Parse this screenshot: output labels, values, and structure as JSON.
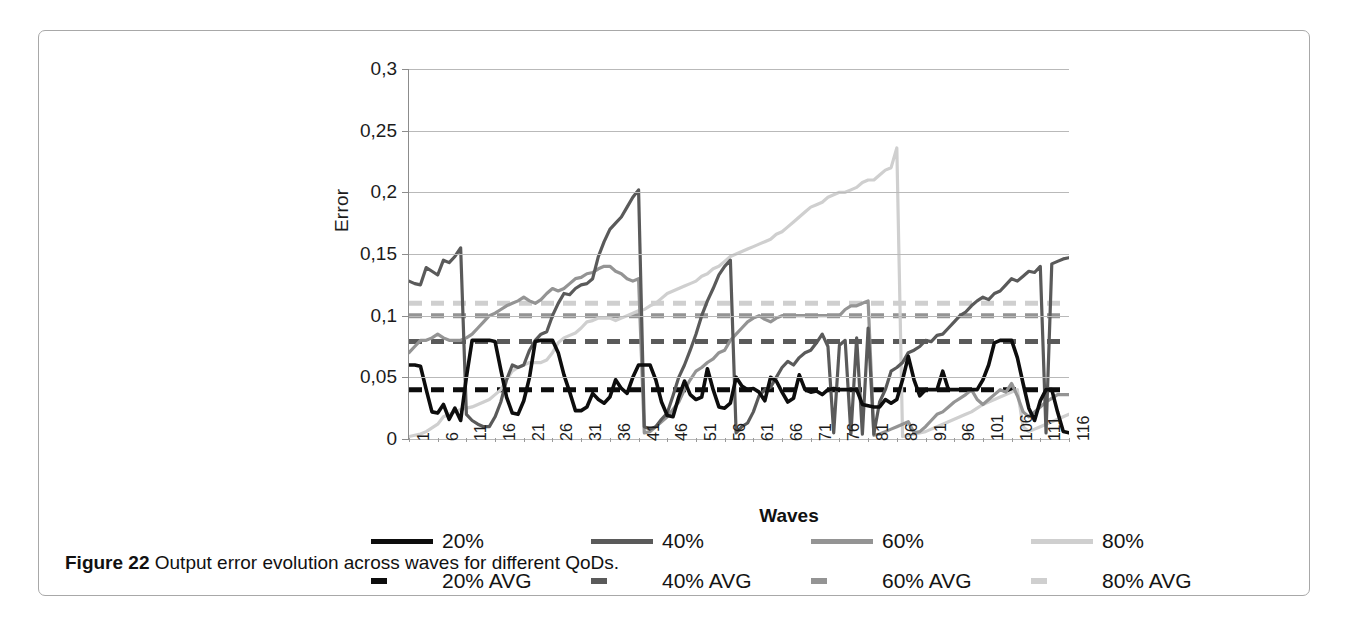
{
  "caption": {
    "label": "Figure 22",
    "text": " Output error evolution across waves for different QoDs."
  },
  "axes": {
    "y_title": "Error",
    "x_title": "Waves",
    "y_ticks": [
      "0",
      "0,05",
      "0,1",
      "0,15",
      "0,2",
      "0,25",
      "0,3"
    ],
    "x_ticks": [
      "1",
      "6",
      "11",
      "16",
      "21",
      "26",
      "31",
      "36",
      "41",
      "46",
      "51",
      "56",
      "61",
      "66",
      "71",
      "76",
      "81",
      "86",
      "91",
      "96",
      "101",
      "106",
      "111",
      "116"
    ]
  },
  "legend": {
    "items": [
      {
        "label": "20%",
        "color": "#0d0d0d",
        "style": "solid"
      },
      {
        "label": "40%",
        "color": "#5a5a5a",
        "style": "solid"
      },
      {
        "label": "60%",
        "color": "#949494",
        "style": "solid"
      },
      {
        "label": "80%",
        "color": "#cfcfcf",
        "style": "solid"
      },
      {
        "label": "20% AVG",
        "color": "#0d0d0d",
        "style": "dashed"
      },
      {
        "label": "40% AVG",
        "color": "#5a5a5a",
        "style": "dashed"
      },
      {
        "label": "60% AVG",
        "color": "#949494",
        "style": "dashed"
      },
      {
        "label": "80% AVG",
        "color": "#cfcfcf",
        "style": "dashed"
      }
    ]
  },
  "chart_data": {
    "type": "line",
    "title": "",
    "xlabel": "Waves",
    "ylabel": "Error",
    "xlim": [
      1,
      116
    ],
    "ylim": [
      0,
      0.3
    ],
    "grid": true,
    "legend_position": "bottom",
    "x": [
      1,
      2,
      3,
      4,
      5,
      6,
      7,
      8,
      9,
      10,
      11,
      12,
      13,
      14,
      15,
      16,
      17,
      18,
      19,
      20,
      21,
      22,
      23,
      24,
      25,
      26,
      27,
      28,
      29,
      30,
      31,
      32,
      33,
      34,
      35,
      36,
      37,
      38,
      39,
      40,
      41,
      42,
      43,
      44,
      45,
      46,
      47,
      48,
      49,
      50,
      51,
      52,
      53,
      54,
      55,
      56,
      57,
      58,
      59,
      60,
      61,
      62,
      63,
      64,
      65,
      66,
      67,
      68,
      69,
      70,
      71,
      72,
      73,
      74,
      75,
      76,
      77,
      78,
      79,
      80,
      81,
      82,
      83,
      84,
      85,
      86,
      87,
      88,
      89,
      90,
      91,
      92,
      93,
      94,
      95,
      96,
      97,
      98,
      99,
      100,
      101,
      102,
      103,
      104,
      105,
      106,
      107,
      108,
      109,
      110,
      111,
      112,
      113,
      114,
      115,
      116
    ],
    "series": [
      {
        "name": "20%",
        "color": "#0d0d0d",
        "style": "solid",
        "values": [
          0.06,
          0.06,
          0.059,
          0.04,
          0.022,
          0.021,
          0.028,
          0.016,
          0.025,
          0.015,
          0.05,
          0.08,
          0.08,
          0.08,
          0.08,
          0.079,
          0.056,
          0.034,
          0.021,
          0.02,
          0.031,
          0.05,
          0.079,
          0.08,
          0.08,
          0.08,
          0.07,
          0.052,
          0.038,
          0.023,
          0.023,
          0.026,
          0.037,
          0.032,
          0.029,
          0.034,
          0.048,
          0.041,
          0.037,
          0.05,
          0.06,
          0.06,
          0.06,
          0.048,
          0.03,
          0.019,
          0.018,
          0.034,
          0.047,
          0.036,
          0.032,
          0.034,
          0.057,
          0.04,
          0.026,
          0.025,
          0.029,
          0.05,
          0.043,
          0.04,
          0.041,
          0.038,
          0.031,
          0.05,
          0.047,
          0.038,
          0.03,
          0.033,
          0.052,
          0.04,
          0.038,
          0.039,
          0.036,
          0.04,
          0.041,
          0.04,
          0.04,
          0.04,
          0.04,
          0.028,
          0.027,
          0.026,
          0.026,
          0.032,
          0.029,
          0.032,
          0.048,
          0.067,
          0.048,
          0.035,
          0.04,
          0.04,
          0.04,
          0.055,
          0.04,
          0.04,
          0.04,
          0.04,
          0.04,
          0.04,
          0.048,
          0.06,
          0.078,
          0.08,
          0.08,
          0.08,
          0.066,
          0.045,
          0.025,
          0.015,
          0.031,
          0.04,
          0.04,
          0.022,
          0.006,
          0.005
        ]
      },
      {
        "name": "40%",
        "color": "#5a5a5a",
        "style": "solid",
        "values": [
          0.128,
          0.126,
          0.125,
          0.139,
          0.136,
          0.133,
          0.145,
          0.143,
          0.148,
          0.155,
          0.02,
          0.015,
          0.012,
          0.01,
          0.01,
          0.018,
          0.03,
          0.048,
          0.06,
          0.058,
          0.06,
          0.072,
          0.08,
          0.085,
          0.087,
          0.1,
          0.11,
          0.118,
          0.117,
          0.122,
          0.125,
          0.126,
          0.13,
          0.148,
          0.16,
          0.17,
          0.175,
          0.18,
          0.188,
          0.196,
          0.202,
          0.01,
          0.008,
          0.01,
          0.016,
          0.021,
          0.035,
          0.05,
          0.06,
          0.072,
          0.085,
          0.1,
          0.112,
          0.122,
          0.133,
          0.14,
          0.145,
          0.005,
          0.01,
          0.013,
          0.022,
          0.035,
          0.04,
          0.042,
          0.05,
          0.058,
          0.063,
          0.06,
          0.066,
          0.07,
          0.072,
          0.078,
          0.085,
          0.075,
          0.005,
          0.076,
          0.08,
          0.004,
          0.082,
          0.004,
          0.09,
          0.004,
          0.03,
          0.04,
          0.055,
          0.058,
          0.062,
          0.07,
          0.072,
          0.075,
          0.08,
          0.079,
          0.084,
          0.085,
          0.09,
          0.095,
          0.1,
          0.103,
          0.108,
          0.112,
          0.115,
          0.113,
          0.118,
          0.12,
          0.125,
          0.13,
          0.128,
          0.132,
          0.136,
          0.135,
          0.14,
          0.005,
          0.142,
          0.144,
          0.146,
          0.147
        ]
      },
      {
        "name": "60%",
        "color": "#949494",
        "style": "solid",
        "values": [
          0.07,
          0.075,
          0.08,
          0.08,
          0.082,
          0.085,
          0.082,
          0.08,
          0.08,
          0.08,
          0.082,
          0.085,
          0.09,
          0.095,
          0.1,
          0.102,
          0.105,
          0.108,
          0.11,
          0.112,
          0.115,
          0.112,
          0.11,
          0.113,
          0.118,
          0.122,
          0.12,
          0.122,
          0.126,
          0.13,
          0.131,
          0.134,
          0.135,
          0.138,
          0.14,
          0.14,
          0.136,
          0.134,
          0.13,
          0.128,
          0.13,
          0.005,
          0.006,
          0.01,
          0.014,
          0.018,
          0.024,
          0.03,
          0.04,
          0.048,
          0.055,
          0.058,
          0.062,
          0.065,
          0.07,
          0.072,
          0.08,
          0.085,
          0.09,
          0.095,
          0.098,
          0.1,
          0.097,
          0.095,
          0.098,
          0.1,
          0.1,
          0.1,
          0.1,
          0.1,
          0.1,
          0.1,
          0.1,
          0.1,
          0.1,
          0.1,
          0.105,
          0.108,
          0.108,
          0.11,
          0.112,
          0.003,
          0.004,
          0.006,
          0.008,
          0.01,
          0.012,
          0.014,
          0.005,
          0.006,
          0.01,
          0.015,
          0.02,
          0.022,
          0.026,
          0.03,
          0.033,
          0.036,
          0.04,
          0.032,
          0.028,
          0.032,
          0.036,
          0.04,
          0.038,
          0.045,
          0.035,
          0.022,
          0.018,
          0.022,
          0.026,
          0.03,
          0.033,
          0.036,
          0.036,
          0.036
        ]
      },
      {
        "name": "80%",
        "color": "#cfcfcf",
        "style": "solid",
        "values": [
          0.002,
          0.003,
          0.004,
          0.006,
          0.009,
          0.012,
          0.018,
          0.02,
          0.022,
          0.024,
          0.025,
          0.026,
          0.028,
          0.03,
          0.032,
          0.036,
          0.04,
          0.048,
          0.055,
          0.058,
          0.06,
          0.062,
          0.062,
          0.062,
          0.064,
          0.07,
          0.078,
          0.082,
          0.084,
          0.086,
          0.09,
          0.095,
          0.096,
          0.098,
          0.098,
          0.098,
          0.096,
          0.098,
          0.1,
          0.102,
          0.104,
          0.105,
          0.108,
          0.11,
          0.114,
          0.118,
          0.12,
          0.122,
          0.124,
          0.126,
          0.128,
          0.132,
          0.134,
          0.138,
          0.14,
          0.144,
          0.148,
          0.15,
          0.152,
          0.154,
          0.156,
          0.158,
          0.16,
          0.162,
          0.166,
          0.168,
          0.172,
          0.176,
          0.18,
          0.184,
          0.188,
          0.19,
          0.192,
          0.196,
          0.198,
          0.2,
          0.2,
          0.202,
          0.204,
          0.208,
          0.21,
          0.21,
          0.214,
          0.218,
          0.22,
          0.236,
          0.002,
          0.003,
          0.004,
          0.005,
          0.006,
          0.008,
          0.01,
          0.012,
          0.014,
          0.016,
          0.018,
          0.02,
          0.022,
          0.025,
          0.028,
          0.03,
          0.032,
          0.034,
          0.036,
          0.038,
          0.04,
          0.01,
          0.006,
          0.008,
          0.01,
          0.012,
          0.014,
          0.016,
          0.018,
          0.02
        ]
      }
    ],
    "average_lines": [
      {
        "name": "20% AVG",
        "value": 0.04,
        "color": "#0d0d0d"
      },
      {
        "name": "40% AVG",
        "value": 0.079,
        "color": "#5a5a5a"
      },
      {
        "name": "60% AVG",
        "value": 0.1,
        "color": "#949494"
      },
      {
        "name": "80% AVG",
        "value": 0.11,
        "color": "#cfcfcf"
      }
    ]
  }
}
